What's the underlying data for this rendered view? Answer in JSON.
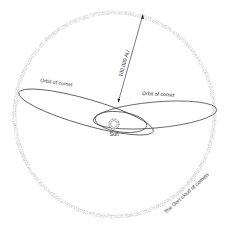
{
  "diagram": {
    "labels": {
      "distance": "100,000 AU",
      "orbit_left": "Orbit of comet",
      "orbit_right": "Orbit of comet",
      "sun": "Sun",
      "cloud": "The Oort cloud of comets"
    },
    "colors": {
      "cloud": "#c8c8c8",
      "line": "#333333",
      "background": "#ffffff"
    }
  }
}
